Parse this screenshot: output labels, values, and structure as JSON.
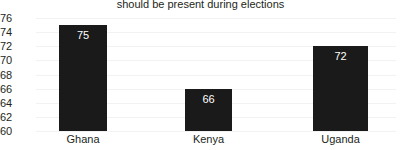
{
  "chart_data": {
    "type": "bar",
    "title": "should be present during elections",
    "xlabel": "",
    "ylabel": "",
    "categories": [
      "Ghana",
      "Kenya",
      "Uganda"
    ],
    "values": [
      75,
      66,
      72
    ],
    "data_labels": [
      "75",
      "66",
      "72"
    ],
    "ylim": [
      60,
      76
    ],
    "ytick_labels": [
      "76",
      "74",
      "72",
      "70",
      "68",
      "66",
      "64",
      "62",
      "60"
    ],
    "yticks": [
      76,
      74,
      72,
      70,
      68,
      66,
      64,
      62,
      60
    ],
    "grid": true,
    "legend": "none",
    "bar_color": "#1a1a1a",
    "label_color": "#ffffff",
    "background_color": "#ffffff",
    "gridline_color": "#f2f2f2",
    "axis_text_color": "#231f20"
  }
}
